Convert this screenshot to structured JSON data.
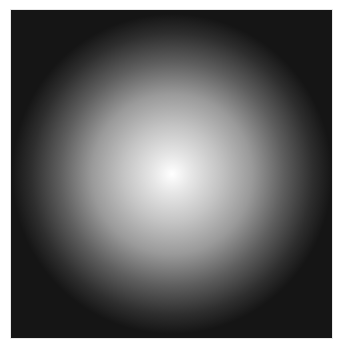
{
  "image": {
    "description": "Radial gradient glow on dark square",
    "colors": {
      "background": "#ffffff",
      "center": "#ffffff",
      "mid": "#9a9a9a",
      "edge": "#151515"
    },
    "center": {
      "x": 161,
      "y": 164
    },
    "radius": 160
  }
}
